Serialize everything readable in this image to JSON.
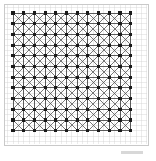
{
  "figure": {
    "frame": {
      "x": 4,
      "y": 4,
      "width": 144,
      "height": 141,
      "stroke_color": "#c9c9c9",
      "stroke_width": 1,
      "fill_color": "#ffffff"
    },
    "lattice": {
      "origin_x": 13,
      "origin_y": 13,
      "cols": 12,
      "rows": 12,
      "cell_size": 10.7,
      "node_count": 144,
      "major_line_color": "#4a4a4a",
      "major_line_width": 0.9,
      "diagonal_color": "#555555",
      "diagonal_width": 0.8,
      "subgrid_color": "#cfcfcf",
      "subgrid_width": 0.4,
      "subgrid_divisions": 2,
      "node_color": "#1a1a1a",
      "node_size": 3.1,
      "node_shape": "square"
    },
    "caption_mark": {
      "label": "",
      "color": "#d8d8d8"
    }
  }
}
